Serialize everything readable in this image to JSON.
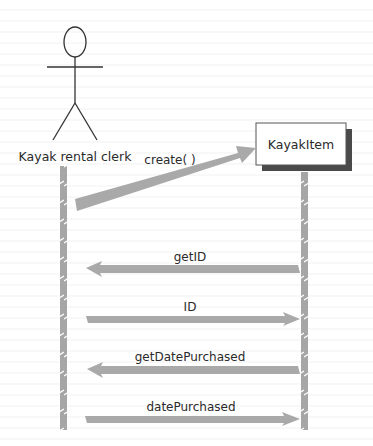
{
  "diagram": {
    "type": "UML sequence diagram",
    "actor": {
      "name": "Kayak rental clerk",
      "icon": "stick-figure-icon"
    },
    "object": {
      "name": "KayakItem"
    },
    "messages": [
      {
        "label": "create( )",
        "from": "Kayak rental clerk",
        "to": "KayakItem",
        "direction": "right"
      },
      {
        "label": "getID",
        "from": "KayakItem",
        "to": "Kayak rental clerk",
        "direction": "left"
      },
      {
        "label": "ID",
        "from": "Kayak rental clerk",
        "to": "KayakItem",
        "direction": "right"
      },
      {
        "label": "getDatePurchased",
        "from": "KayakItem",
        "to": "Kayak rental clerk",
        "direction": "left"
      },
      {
        "label": "datePurchased",
        "from": "Kayak rental clerk",
        "to": "KayakItem",
        "direction": "right"
      }
    ],
    "colors": {
      "arrow": "#a9a9a9",
      "lifeline": "#a6a6a6",
      "box_shadow": "#4a4a4a",
      "box_border": "#555555",
      "line": "#333333",
      "text": "#2a2a2a"
    }
  }
}
